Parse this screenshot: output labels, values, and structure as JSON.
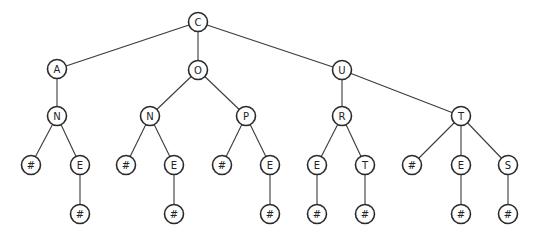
{
  "diagram": {
    "type": "trie",
    "nodes": [
      {
        "id": "n0",
        "label": "C",
        "parent": null
      },
      {
        "id": "n1",
        "label": "A",
        "parent": "n0"
      },
      {
        "id": "n2",
        "label": "O",
        "parent": "n0"
      },
      {
        "id": "n3",
        "label": "U",
        "parent": "n0"
      },
      {
        "id": "n4",
        "label": "N",
        "parent": "n1"
      },
      {
        "id": "n5",
        "label": "N",
        "parent": "n2"
      },
      {
        "id": "n6",
        "label": "P",
        "parent": "n2"
      },
      {
        "id": "n7",
        "label": "R",
        "parent": "n3"
      },
      {
        "id": "n8",
        "label": "T",
        "parent": "n3"
      },
      {
        "id": "n9",
        "label": "#",
        "parent": "n4"
      },
      {
        "id": "n10",
        "label": "E",
        "parent": "n4"
      },
      {
        "id": "n11",
        "label": "#",
        "parent": "n5"
      },
      {
        "id": "n12",
        "label": "E",
        "parent": "n5"
      },
      {
        "id": "n13",
        "label": "#",
        "parent": "n6"
      },
      {
        "id": "n14",
        "label": "E",
        "parent": "n6"
      },
      {
        "id": "n15",
        "label": "E",
        "parent": "n7"
      },
      {
        "id": "n16",
        "label": "T",
        "parent": "n7"
      },
      {
        "id": "n17",
        "label": "#",
        "parent": "n8"
      },
      {
        "id": "n18",
        "label": "E",
        "parent": "n8"
      },
      {
        "id": "n19",
        "label": "S",
        "parent": "n8"
      },
      {
        "id": "n20",
        "label": "#",
        "parent": "n10"
      },
      {
        "id": "n21",
        "label": "#",
        "parent": "n12"
      },
      {
        "id": "n22",
        "label": "#",
        "parent": "n14"
      },
      {
        "id": "n23",
        "label": "#",
        "parent": "n15"
      },
      {
        "id": "n24",
        "label": "#",
        "parent": "n16"
      },
      {
        "id": "n25",
        "label": "#",
        "parent": "n18"
      },
      {
        "id": "n26",
        "label": "#",
        "parent": "n19"
      }
    ]
  }
}
